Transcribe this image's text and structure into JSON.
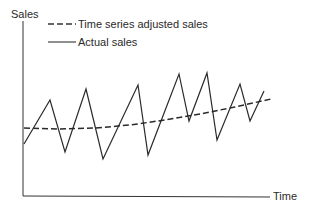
{
  "chart_data": {
    "type": "line",
    "title": "",
    "xlabel": "Time",
    "ylabel": "Sales",
    "grid": false,
    "legend_position": "top-left",
    "legend": [
      {
        "name": "Time series adjusted sales",
        "style": "dashed"
      },
      {
        "name": "Actual sales",
        "style": "solid"
      }
    ],
    "series": [
      {
        "name": "Actual sales",
        "style": "solid",
        "points_px": [
          [
            24,
            144
          ],
          [
            50,
            100
          ],
          [
            65,
            152
          ],
          [
            86,
            89
          ],
          [
            103,
            159
          ],
          [
            138,
            85
          ],
          [
            148,
            155
          ],
          [
            179,
            74
          ],
          [
            189,
            121
          ],
          [
            207,
            73
          ],
          [
            217,
            140
          ],
          [
            240,
            84
          ],
          [
            250,
            121
          ],
          [
            264,
            91
          ]
        ]
      },
      {
        "name": "Time series adjusted sales",
        "style": "dashed",
        "points_px": [
          [
            24,
            128
          ],
          [
            60,
            129
          ],
          [
            95,
            128
          ],
          [
            130,
            125
          ],
          [
            165,
            120
          ],
          [
            200,
            114
          ],
          [
            235,
            107
          ],
          [
            271,
            99
          ]
        ]
      }
    ]
  },
  "labels": {
    "y_axis": "Sales",
    "x_axis": "Time",
    "legend_dashed": "Time series adjusted sales",
    "legend_solid": "Actual sales"
  },
  "colors": {
    "line": "#2a2a2a",
    "background": "#ffffff"
  }
}
